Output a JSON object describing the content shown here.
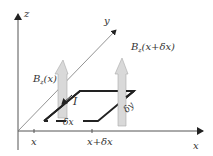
{
  "diagram": {
    "type": "current loop in magnetic field (3D axes)",
    "axes": {
      "x_label": "x",
      "y_label": "y",
      "z_label": "z"
    },
    "ticks": {
      "x_tick_1": "x",
      "x_tick_2": "x+δx"
    },
    "loop": {
      "width_label": "δx",
      "depth_label": "δy",
      "current_label": "I"
    },
    "field_arrows": {
      "left": {
        "label_main": "B",
        "label_sub": "z",
        "label_arg": "(x)"
      },
      "right": {
        "label_main": "B",
        "label_sub": "z",
        "label_arg": "(x+δx)"
      }
    },
    "colors": {
      "axis": "#555555",
      "loop": "#222222",
      "arrow_fill": "#d9d9d9",
      "arrow_stroke": "#aaaaaa",
      "text": "#333333"
    }
  }
}
